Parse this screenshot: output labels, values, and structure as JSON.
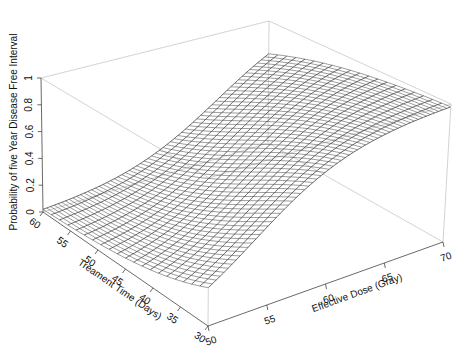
{
  "chart_data": {
    "type": "surface3d",
    "title": "",
    "xlabel": "Effective Dose (Gray)",
    "ylabel": "Treament Time (Days)",
    "zlabel": "Probability of five Year Disease Free Interval",
    "x_ticks": [
      50,
      55,
      60,
      65,
      70
    ],
    "y_ticks": [
      30,
      35,
      40,
      45,
      50,
      55,
      60
    ],
    "z_ticks": [
      "0",
      "0.2",
      "0.4",
      "0.6",
      "0.8",
      "1"
    ],
    "xlim": [
      50,
      70
    ],
    "ylim": [
      30,
      60
    ],
    "zlim": [
      0,
      1
    ],
    "model": "logistic",
    "coefficients": {
      "intercept": -10.45,
      "dose": 0.245,
      "time": -0.095
    },
    "corner_values": [
      {
        "dose": 50,
        "time": 60,
        "p": 0.02
      },
      {
        "dose": 50,
        "time": 30,
        "p": 0.35
      },
      {
        "dose": 70,
        "time": 60,
        "p": 0.8
      },
      {
        "dose": 70,
        "time": 30,
        "p": 0.98
      }
    ],
    "grid": {
      "dose_lines": 60,
      "time_lines": 20
    },
    "legend": null
  },
  "colors": {
    "mesh": "#4a4a4a",
    "box": "#c8c8c8",
    "axis": "#444444",
    "background": "#ffffff"
  }
}
